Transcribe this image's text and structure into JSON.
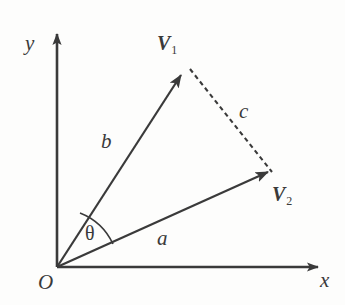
{
  "figure": {
    "background_color": "#fdfdfc",
    "ink_color": "#3a3a3a"
  },
  "axes": {
    "x_label": "x",
    "y_label": "y",
    "origin_label": "O",
    "x_axis": {
      "x1": 57,
      "y1": 267,
      "x2": 325,
      "y2": 267
    },
    "y_axis": {
      "x1": 57,
      "y1": 267,
      "x2": 57,
      "y2": 28
    }
  },
  "vectors": [
    {
      "name": "V1",
      "label": "V",
      "subscript": "1",
      "magnitude_label": "b",
      "from": {
        "x": 57,
        "y": 267
      },
      "to": {
        "x": 187,
        "y": 66
      },
      "style": "solid",
      "angle_deg": 57
    },
    {
      "name": "V2",
      "label": "V",
      "subscript": "2",
      "magnitude_label": "a",
      "from": {
        "x": 57,
        "y": 267
      },
      "to": {
        "x": 275,
        "y": 177
      },
      "style": "solid",
      "angle_deg": 22
    }
  ],
  "connector": {
    "name": "c",
    "label": "c",
    "style": "dashed",
    "from": {
      "x": 187,
      "y": 66
    },
    "to": {
      "x": 275,
      "y": 177
    }
  },
  "angle": {
    "label": "θ",
    "vertex": {
      "x": 57,
      "y": 267
    },
    "between": [
      "V2",
      "V1"
    ],
    "start_deg": 22,
    "end_deg": 57
  },
  "labels": {
    "y": "y",
    "x": "x",
    "origin": "O",
    "b": "b",
    "a": "a",
    "c": "c",
    "theta": "θ",
    "v1_letter": "V",
    "v1_sub": "1",
    "v2_letter": "V",
    "v2_sub": "2"
  }
}
